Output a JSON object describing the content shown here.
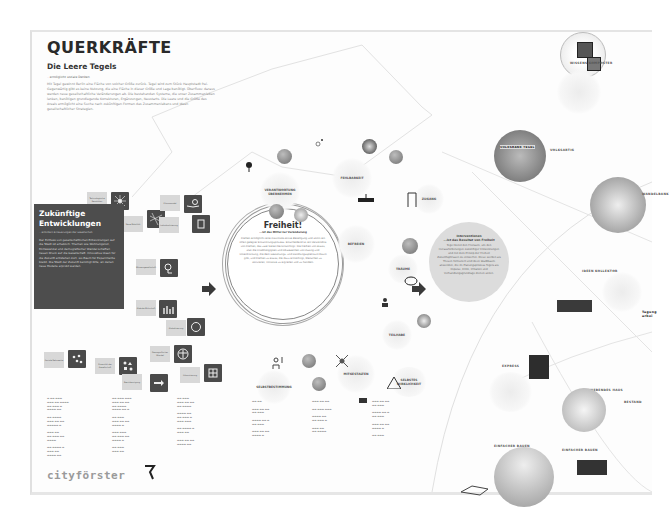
{
  "poster": {
    "title": "QUERKRÄFTE",
    "subtitle": "Die Leere Tegels",
    "tagline": "...ermöglicht soziale Denken",
    "intro": "Mit Tegel gewinnt Berlin eine Fläche von solcher Größe zurück. Tegel wird zum Stück Hauptstadt frei. Gegenwärtig gibt es keine Nutzung, die eine Fläche in dieser Größe und Lage benötigt. Überfluss: daraus werden neue gesellschaftliche Veränderungen ab. Die bestehenden Systeme, die unser Zusammenleben lenken, benötigen grundlegende Korrekturen, Ergänzungen, Neustarts. Die Leere und die Größe des Areals ermöglicht eine Suche nach zukünftigen Formen des Zusammenlebens und Ideen gesellschaftlicher Strategien.",
    "logo": "cityförster"
  },
  "left_panel": {
    "heading_line1": "Zukünftige",
    "heading_line2": "Entwicklungen",
    "sub": "...erfordern Erneuerungen der Gesellschaft",
    "body": "Der Einfluss von gesellschaftlichen Entwicklungen auf die Stadt ist erheblich. Themen wie Wohnungsnot, Klimawandel und demografischer Wandel schaffen neuen Druck auf die Gesellschaft. Innovative Ideen für die Zukunft entstehen dort, wo Raum für Experimente bleibt. Die Stadt der Zukunft benötigt Orte, an denen neue Modelle erprobt werden.",
    "tiles": [
      {
        "tag": "Ressourcenknappheit",
        "icon": "footprint-icon"
      },
      {
        "tag": "Technologische Revolution",
        "icon": "network-icon"
      },
      {
        "tag": "Neue Mobilität",
        "icon": "mobility-icon"
      },
      {
        "tag": "Klimawandel",
        "icon": "climate-icon"
      },
      {
        "tag": "Individualisierung",
        "icon": "clipboard-icon"
      },
      {
        "tag": "Wissensgesellschaft",
        "icon": "knowledge-icon"
      },
      {
        "tag": "Globale Wirtschaft",
        "icon": "chart-icon"
      },
      {
        "tag": "Globalisierung",
        "icon": "globe-icon"
      },
      {
        "tag": "Soziale Netzwerke",
        "icon": "social-icon"
      },
      {
        "tag": "Diversität der Gesellschaft",
        "icon": "diversity-icon"
      },
      {
        "tag": "Demografischer Wandel",
        "icon": "human-icon"
      },
      {
        "tag": "Beschleunigung",
        "icon": "arrow-icon"
      },
      {
        "tag": "Urbanisierung",
        "icon": "urban-icon"
      }
    ]
  },
  "center": {
    "freiheit": {
      "title": "Freiheit!",
      "sub": "...ist das Mittel zur Veränderung",
      "body": "Freiheit ermöglicht eine maximale aktive Beteiligung und somit ein offen gelegter Entwicklungsprozess. Entscheidend ist ein Verständnis von Freiheit, das zwei Seiten berücksichtigt: Die Freiheit von etwas, also die Unabhängigkeit und Abwesenheit von Zwang und Unterdrückung, die dem Gestaltungs- und Handlungsspielraum Raum gibt, und Freiheit zu etwas, die dazu ermächtigt, Menschen zu aktivieren, Initiative zu ergreifen und zu handeln."
    },
    "nodes": [
      {
        "label": "VERANTWORTUNG ÜBERNEHMEN"
      },
      {
        "label": "FEHLBARKEIT"
      },
      {
        "label": "ZUGANG"
      },
      {
        "label": "BEFREIEN"
      },
      {
        "label": "TRÄUME"
      },
      {
        "label": "TEILHABE"
      },
      {
        "label": "MITGESTALTEN"
      },
      {
        "label": "SELBSTBESTIMMUNG"
      },
      {
        "label": "SELBSTBESTIMMTE STIMMUNG"
      },
      {
        "label": "SELBSTES WIRKLICHKEIT"
      }
    ]
  },
  "right": {
    "summary": {
      "heading1": "Interventionen",
      "heading2": "...ist das Resultat von Freiheit",
      "body": "Tegel bietet den Freiraum, um den Herausforderungen zukünftiger Entwicklungen und mit dem Prinzip der Freiheit Zukunftsphrasen zu entwerfen. Diese werden als Thesen formuliert und Ideen Stadtbaum anwenden, die im Planungsprozess Tegels als Impulse, Kritik, Irritation und Verhandlungsgrundlage dienen sollen.",
      "highlight_words": [
        "Thesen",
        "Ideen"
      ]
    },
    "circles": [
      {
        "label": "WISSENS KOMPOSTER"
      },
      {
        "label": "VOLKSBANK TEGEL"
      },
      {
        "label": "VOLKSARTIG"
      },
      {
        "label": "WANDELBANK"
      },
      {
        "label": "IDEEN KOLLEKTOR"
      },
      {
        "label": "Tagung arbei"
      },
      {
        "label": "EXPRESS"
      },
      {
        "label": "SCHWEBENDES HAUS"
      },
      {
        "label": "NEULAND ERBEN"
      },
      {
        "label": "BESTAND"
      },
      {
        "label": "EINFACHER BAUEN"
      }
    ],
    "poster_card": "VOLKSBANK TEGEL"
  },
  "references": {
    "columns": 6
  },
  "colors": {
    "dark_tile": "#4a4a4a",
    "light_tag": "#d8d8d8",
    "summary_circle": "#dcdcdc",
    "text_dark": "#2a2a2a"
  }
}
